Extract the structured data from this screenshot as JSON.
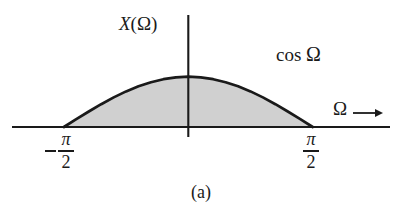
{
  "figure": {
    "caption": "(a)",
    "background_color": "#ffffff",
    "stroke_color": "#1a1a1a",
    "fill_color": "#d0d0d0"
  },
  "labels": {
    "y_axis_label": "X(Ω)",
    "y_axis_label_symbol": "X",
    "y_axis_label_arg": "(Ω)",
    "curve_label_text": "cos",
    "curve_label_symbol": "Ω",
    "x_axis_label": "Ω",
    "arrow_icon": "arrow-right-icon",
    "left_tick_minus": "−",
    "left_tick_numerator": "π",
    "left_tick_denominator": "2",
    "right_tick_numerator": "π",
    "right_tick_denominator": "2"
  },
  "chart_data": {
    "type": "line",
    "title": "X(Ω)",
    "xlabel": "Ω",
    "ylabel": "X(Ω)",
    "series": [
      {
        "name": "cos Ω",
        "expression": "cos(Ω)",
        "x": [
          -1.5708,
          -1.4137,
          -1.2566,
          -1.0996,
          -0.9425,
          -0.7854,
          -0.6283,
          -0.4712,
          -0.3142,
          -0.1571,
          0.0,
          0.1571,
          0.3142,
          0.4712,
          0.6283,
          0.7854,
          0.9425,
          1.0996,
          1.2566,
          1.4137,
          1.5708
        ],
        "values": [
          0.0,
          0.1564,
          0.309,
          0.454,
          0.5878,
          0.7071,
          0.809,
          0.891,
          0.9511,
          0.9877,
          1.0,
          0.9877,
          0.9511,
          0.891,
          0.809,
          0.7071,
          0.5878,
          0.454,
          0.309,
          0.1564,
          0.0
        ]
      }
    ],
    "xlim": [
      -2.38,
      2.48
    ],
    "ylim": [
      0,
      1.13
    ],
    "xticks": [
      -1.5708,
      1.5708
    ],
    "xticklabels": [
      "-π/2",
      "π/2"
    ],
    "grid": false,
    "legend": false,
    "shaded_region": {
      "label": "cos Ω",
      "from": -1.5708,
      "to": 1.5708,
      "color": "#d0d0d0"
    },
    "annotations": [
      {
        "text": "X(Ω)",
        "x": -0.33,
        "y": 1.1
      },
      {
        "text": "cos Ω",
        "x": 0.95,
        "y": 0.88
      },
      {
        "text": "Ω",
        "x": 1.95,
        "y": 0.27
      }
    ]
  }
}
